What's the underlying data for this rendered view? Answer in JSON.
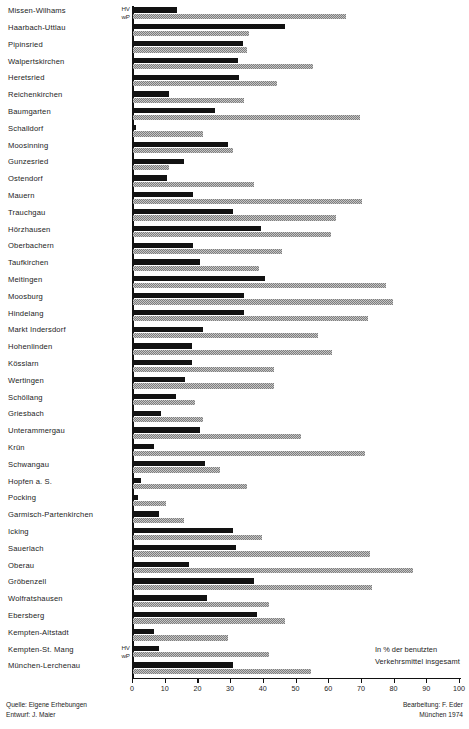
{
  "chart_data": {
    "type": "bar",
    "orientation": "horizontal",
    "title": "",
    "xlabel": "",
    "ylabel": "",
    "xlim": [
      0,
      100
    ],
    "grid": false,
    "tick_labels": [
      "0",
      "10",
      "20",
      "30",
      "40",
      "50",
      "60",
      "70",
      "80",
      "90",
      "100"
    ],
    "tick_values": [
      0,
      10,
      20,
      30,
      40,
      50,
      60,
      70,
      80,
      90,
      100
    ],
    "legend_position": "inline-left",
    "annotation_line1": "In % der benutzten",
    "annotation_line2": "Verkehrsmittel insgesamt",
    "series_tag_hv": "HV",
    "series_tag_wp": "wP",
    "series": [
      {
        "name": "HV",
        "color": "#121212"
      },
      {
        "name": "wP",
        "color": "#7e7e7e"
      }
    ],
    "categories": [
      "Missen-Wilhams",
      "Haarbach-Uttlau",
      "Pipinsried",
      "Walpertskirchen",
      "Heretsried",
      "Reichenkirchen",
      "Baumgarten",
      "Schalldorf",
      "Moosinning",
      "Gunzesried",
      "Ostendorf",
      "Mauern",
      "Trauchgau",
      "Hörzhausen",
      "Oberbachern",
      "Taufkirchen",
      "Meitingen",
      "Moosburg",
      "Hindelang",
      "Markt Indersdorf",
      "Hohenlinden",
      "Kösslarn",
      "Wertingen",
      "Schöllang",
      "Griesbach",
      "Unterammergau",
      "Krün",
      "Schwangau",
      "Hopfen a. S.",
      "Pocking",
      "Garmisch-Partenkirchen",
      "Icking",
      "Sauerlach",
      "Oberau",
      "Gröbenzell",
      "Wolfratshausen",
      "Ebersberg",
      "Kempten-Altstadt",
      "Kempten-St. Mang",
      "München-Lerchenau"
    ],
    "values_hv": [
      13.5,
      46.5,
      33.5,
      32.0,
      32.5,
      11.0,
      25.0,
      1.0,
      29.0,
      15.5,
      10.5,
      18.5,
      30.5,
      39.0,
      18.5,
      20.5,
      40.5,
      34.0,
      34.0,
      21.5,
      18.0,
      18.0,
      16.0,
      13.0,
      8.5,
      20.5,
      6.5,
      22.0,
      2.5,
      1.5,
      8.0,
      30.5,
      31.5,
      17.0,
      37.0,
      22.5,
      38.0,
      6.5,
      8.0,
      30.5
    ],
    "values_wp": [
      65.0,
      35.5,
      35.0,
      55.0,
      44.0,
      34.0,
      69.5,
      21.5,
      30.5,
      11.0,
      37.0,
      70.0,
      62.0,
      60.5,
      45.5,
      38.5,
      77.5,
      79.5,
      72.0,
      56.5,
      61.0,
      43.0,
      43.0,
      19.0,
      21.5,
      51.5,
      71.0,
      26.5,
      35.0,
      10.0,
      15.5,
      39.5,
      72.5,
      85.5,
      73.0,
      41.5,
      46.5,
      29.0,
      41.5,
      54.5
    ]
  },
  "credits": {
    "source_line1": "Quelle: Eigene Erhebungen",
    "source_line2": "Entwurf: J. Maier",
    "editor_line1": "Bearbeitung: F. Eder",
    "editor_line2": "München 1974"
  }
}
